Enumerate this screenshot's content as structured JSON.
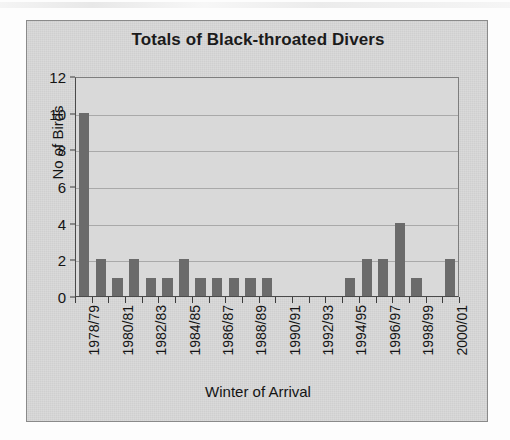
{
  "chart_data": {
    "type": "bar",
    "title": "Totals of Black-throated Divers",
    "xlabel": "Winter of Arrival",
    "ylabel": "No of Birds",
    "ylim": [
      0,
      12
    ],
    "ytick_values": [
      0,
      2,
      4,
      6,
      8,
      10,
      12
    ],
    "ytick_labels": [
      "0",
      "2",
      "4",
      "6",
      "8",
      "10",
      "12"
    ],
    "grid": true,
    "legend": "none",
    "bar_color": "#6b6b6b",
    "plot_background": "#d9d9d9",
    "categories": [
      "1978/79",
      "1979/80",
      "1980/81",
      "1981/82",
      "1982/83",
      "1983/84",
      "1984/85",
      "1985/86",
      "1986/87",
      "1987/88",
      "1988/89",
      "1989/90",
      "1990/91",
      "1991/92",
      "1992/93",
      "1993/94",
      "1994/95",
      "1995/96",
      "1996/97",
      "1997/98",
      "1998/99",
      "1999/00",
      "2000/01"
    ],
    "values": [
      10,
      2,
      1,
      2,
      1,
      1,
      2,
      1,
      1,
      1,
      1,
      1,
      0,
      0,
      0,
      0,
      1,
      2,
      2,
      4,
      1,
      0,
      2
    ],
    "tick_labels_shown": [
      "1978/79",
      "",
      "1980/81",
      "",
      "1982/83",
      "",
      "1984/85",
      "",
      "1986/87",
      "",
      "1988/89",
      "",
      "1990/91",
      "",
      "1992/93",
      "",
      "1994/95",
      "",
      "1996/97",
      "",
      "1998/99",
      "",
      "2000/01"
    ]
  }
}
